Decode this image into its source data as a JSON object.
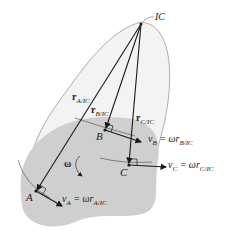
{
  "diagram": {
    "ic_label": "IC",
    "points": {
      "A": "A",
      "B": "B",
      "C": "C"
    },
    "position_vectors": {
      "rA": {
        "main": "r",
        "sub": "A/IC"
      },
      "rB": {
        "main": "r",
        "sub": "B/IC"
      },
      "rC": {
        "main": "r",
        "sub": "C/IC"
      }
    },
    "velocities": {
      "vA": {
        "lhs": "v",
        "lhs_sub": "A",
        "eq": " = ωr",
        "rhs_sub": "A/IC"
      },
      "vB": {
        "lhs": "v",
        "lhs_sub": "B",
        "eq": " = ωr",
        "rhs_sub": "B/IC"
      },
      "vC": {
        "lhs": "v",
        "lhs_sub": "C",
        "eq": " = ωr",
        "rhs_sub": "C/IC"
      }
    },
    "omega_label": "ω",
    "colors": {
      "body_fill": "#cfcfcf",
      "extended_body_fill": "#f2f2f2",
      "outline": "#9a9a9a",
      "line": "#1a1a1a"
    }
  }
}
